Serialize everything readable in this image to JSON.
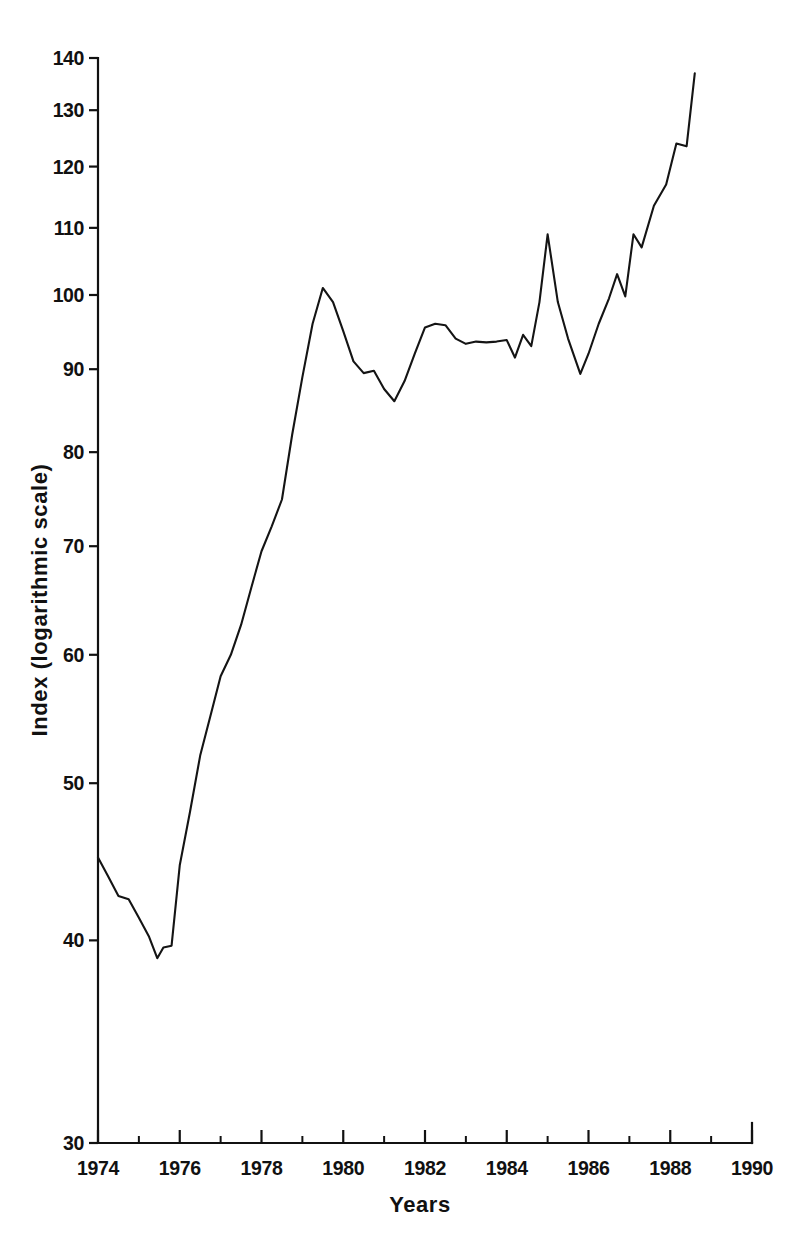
{
  "chart_data": {
    "type": "line",
    "title": "",
    "xlabel": "Years",
    "ylabel": "Index (logarithmic scale)",
    "yscale": "log",
    "ylim": [
      30,
      140
    ],
    "xlim": [
      1974,
      1990
    ],
    "grid": false,
    "legend": null,
    "line_color": "#141414",
    "background_color": "#ffffff",
    "y_ticks": [
      30,
      40,
      50,
      60,
      70,
      80,
      90,
      100,
      110,
      120,
      130,
      140
    ],
    "y_tick_labels": [
      "30",
      "40",
      "50",
      "60",
      "70",
      "80",
      "90",
      "100",
      "110",
      "120",
      "130",
      "140"
    ],
    "x_ticks_major": [
      1974,
      1976,
      1978,
      1980,
      1982,
      1984,
      1986,
      1988,
      1990
    ],
    "x_tick_labels": [
      "1974",
      "1976",
      "1978",
      "1980",
      "1982",
      "1984",
      "1986",
      "1988",
      "1990"
    ],
    "x_ticks_minor": [
      1975,
      1977,
      1979,
      1981,
      1983,
      1985,
      1987,
      1989
    ],
    "series": [
      {
        "name": "Index",
        "x": [
          1974.0,
          1974.25,
          1974.5,
          1974.75,
          1975.0,
          1975.25,
          1975.45,
          1975.6,
          1975.8,
          1976.0,
          1976.25,
          1976.5,
          1976.75,
          1977.0,
          1977.25,
          1977.5,
          1977.75,
          1978.0,
          1978.25,
          1978.5,
          1978.75,
          1979.0,
          1979.25,
          1979.5,
          1979.75,
          1980.0,
          1980.25,
          1980.5,
          1980.75,
          1981.0,
          1981.25,
          1981.5,
          1981.75,
          1982.0,
          1982.25,
          1982.5,
          1982.75,
          1983.0,
          1983.25,
          1983.5,
          1983.75,
          1984.0,
          1984.2,
          1984.4,
          1984.6,
          1984.8,
          1985.0,
          1985.25,
          1985.5,
          1985.8,
          1986.0,
          1986.25,
          1986.5,
          1986.7,
          1986.9,
          1987.1,
          1987.3,
          1987.6,
          1987.9,
          1988.15,
          1988.4,
          1988.6
        ],
        "y": [
          45.0,
          43.8,
          42.6,
          42.4,
          41.3,
          40.2,
          39.0,
          39.6,
          39.7,
          44.5,
          48.0,
          52.0,
          55.0,
          58.2,
          60.0,
          62.6,
          66.0,
          69.5,
          72.0,
          74.8,
          82.0,
          89.0,
          96.0,
          101.0,
          99.0,
          95.0,
          91.0,
          89.5,
          89.8,
          87.5,
          86.0,
          88.5,
          92.0,
          95.5,
          96.0,
          95.8,
          94.0,
          93.3,
          93.6,
          93.5,
          93.6,
          93.8,
          91.5,
          94.5,
          93.0,
          99.0,
          109.0,
          99.0,
          94.0,
          89.4,
          92.0,
          96.0,
          99.5,
          103.0,
          99.8,
          109.0,
          107.0,
          113.5,
          117.0,
          124.0,
          123.5,
          137.0
        ]
      }
    ]
  }
}
